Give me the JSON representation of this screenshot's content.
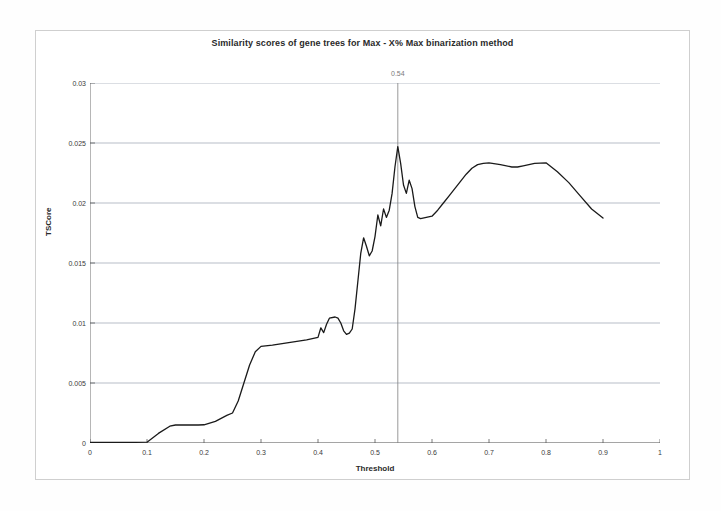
{
  "figure": {
    "title": "Similarity scores of gene trees for Max - X% Max binarization method",
    "frame_color": "#cfcfcf",
    "background": "#ffffff"
  },
  "annotations": {
    "vertical_marker": {
      "label": "0.54",
      "x_value": 0.54,
      "color": "#808080"
    }
  },
  "chart_data": {
    "type": "line",
    "title": "Similarity scores of gene trees for Max - X% Max binarization method",
    "xlabel": "Threshold",
    "ylabel": "TSCore",
    "xlim": [
      0,
      1
    ],
    "ylim": [
      0,
      0.03
    ],
    "grid": true,
    "legend": null,
    "line_color": "#1a1a1a",
    "xticks": [
      "0",
      "0.1",
      "0.2",
      "0.3",
      "0.4",
      "0.5",
      "0.6",
      "0.7",
      "0.8",
      "0.9",
      "1"
    ],
    "xtick_values": [
      0,
      0.1,
      0.2,
      0.3,
      0.4,
      0.5,
      0.6,
      0.7,
      0.8,
      0.9,
      1
    ],
    "yticks": [
      "0",
      "0.005",
      "0.01",
      "0.015",
      "0.02",
      "0.025",
      "0.03"
    ],
    "ytick_values": [
      0,
      0.005,
      0.01,
      0.015,
      0.02,
      0.025,
      0.03
    ],
    "series": [
      {
        "name": "TSCore",
        "x": [
          0.0,
          0.02,
          0.04,
          0.06,
          0.08,
          0.1,
          0.12,
          0.14,
          0.15,
          0.17,
          0.19,
          0.2,
          0.22,
          0.24,
          0.25,
          0.26,
          0.27,
          0.28,
          0.29,
          0.3,
          0.32,
          0.34,
          0.36,
          0.38,
          0.39,
          0.4,
          0.405,
          0.41,
          0.415,
          0.42,
          0.43,
          0.435,
          0.44,
          0.445,
          0.45,
          0.455,
          0.46,
          0.465,
          0.47,
          0.475,
          0.48,
          0.485,
          0.49,
          0.495,
          0.5,
          0.505,
          0.51,
          0.515,
          0.52,
          0.525,
          0.53,
          0.535,
          0.54,
          0.545,
          0.55,
          0.555,
          0.56,
          0.565,
          0.57,
          0.575,
          0.58,
          0.59,
          0.6,
          0.61,
          0.62,
          0.63,
          0.64,
          0.65,
          0.66,
          0.67,
          0.68,
          0.69,
          0.7,
          0.72,
          0.74,
          0.75,
          0.76,
          0.78,
          0.8,
          0.82,
          0.84,
          0.86,
          0.88,
          0.9
        ],
        "values": [
          5e-05,
          5e-05,
          5e-05,
          6e-05,
          6e-05,
          7e-05,
          0.0008,
          0.0014,
          0.0015,
          0.0015,
          0.0015,
          0.00152,
          0.0018,
          0.0023,
          0.0025,
          0.0035,
          0.005,
          0.0065,
          0.0076,
          0.00805,
          0.00815,
          0.0083,
          0.00845,
          0.0086,
          0.0087,
          0.0088,
          0.0096,
          0.0092,
          0.0099,
          0.0104,
          0.0105,
          0.0104,
          0.01,
          0.00935,
          0.00905,
          0.00915,
          0.0095,
          0.0112,
          0.0135,
          0.0158,
          0.0171,
          0.0164,
          0.0156,
          0.016,
          0.0172,
          0.019,
          0.0181,
          0.0195,
          0.0188,
          0.0194,
          0.0208,
          0.023,
          0.0247,
          0.0233,
          0.0215,
          0.0208,
          0.0219,
          0.0212,
          0.0197,
          0.0188,
          0.0187,
          0.0188,
          0.0189,
          0.0194,
          0.02,
          0.0206,
          0.0212,
          0.0218,
          0.0224,
          0.0229,
          0.0232,
          0.0233,
          0.02335,
          0.0232,
          0.023,
          0.023,
          0.0231,
          0.0233,
          0.02335,
          0.0226,
          0.0217,
          0.0206,
          0.0195,
          0.01875
        ]
      }
    ]
  }
}
